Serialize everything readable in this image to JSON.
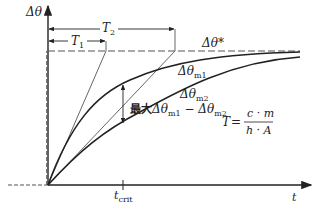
{
  "diagram": {
    "axes": {
      "y_label": "Δθ",
      "x_label": "t",
      "x_tick_label_main": "t",
      "x_tick_label_sub": "crit"
    },
    "asymptote": {
      "label": "Δθ*"
    },
    "time_constants": [
      {
        "label_main": "T",
        "label_sub": "1"
      },
      {
        "label_main": "T",
        "label_sub": "2"
      }
    ],
    "curves": [
      {
        "label_main": "Δθ",
        "label_sub": "m1"
      },
      {
        "label_main": "Δθ",
        "label_sub": "m2"
      }
    ],
    "max_difference": {
      "prefix": "最大",
      "term1_main": "Δθ",
      "term1_sub": "m1",
      "minus": " − ",
      "term2_main": "Δθ",
      "term2_sub": "m2"
    },
    "formula": {
      "lhs": "T",
      "equals": "=",
      "numerator": "c · m",
      "denominator": "h · A"
    },
    "colors": {
      "line": "#222222",
      "thin_line": "#555555",
      "background": "#ffffff"
    }
  }
}
